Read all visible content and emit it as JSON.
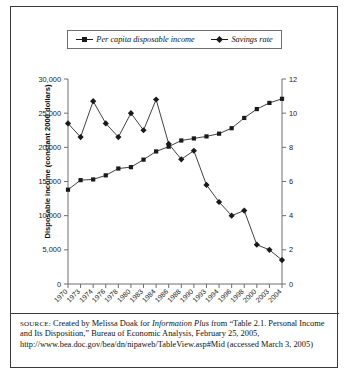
{
  "legend": {
    "items": [
      {
        "label": "Per capita disposable income",
        "marker": "square-marker-icon"
      },
      {
        "label": "Savings rate",
        "marker": "diamond-marker-icon"
      }
    ]
  },
  "axes": {
    "left_title": "Disposable income (constant 2000 dollars)",
    "right_title": "Savings rate (as percent of disposable income)",
    "left_ticks": [
      "30,000",
      "25,000",
      "20,000",
      "15,000",
      "10,000",
      "5,000",
      "0"
    ],
    "right_ticks": [
      "12",
      "10",
      "8",
      "6",
      "4",
      "2",
      "0"
    ]
  },
  "source": {
    "prefix": "SOURCE:",
    "text_1": " Created by Melissa Doak for ",
    "italic_1": "Information Plus",
    "text_2": " from “Table 2.1. Personal Income and Its Disposition,” Bureau of Economic Analysis, February 25, 2005, http://www.bea.doc.gov/bea/dn/nipaweb/TableView.asp#Mid (accessed March 3, 2005)"
  },
  "chart_data": {
    "type": "line",
    "title": "",
    "xlabel": "",
    "ylabel": "Disposable income (constant 2000 dollars)",
    "y2label": "Savings rate (as percent of disposable income)",
    "ylim": [
      0,
      30000
    ],
    "y2lim": [
      0,
      12
    ],
    "grid": false,
    "legend_position": "top",
    "categories": [
      "1970",
      "1973",
      "1974",
      "1976",
      "1978",
      "1980",
      "1983",
      "1984",
      "1986",
      "1988",
      "1990",
      "1993",
      "1994",
      "1996",
      "1998",
      "2000",
      "2003",
      "2004"
    ],
    "series": [
      {
        "name": "Per capita disposable income",
        "axis": "left",
        "marker": "square",
        "values": [
          13800,
          15200,
          15300,
          15900,
          16900,
          17100,
          18200,
          19400,
          20100,
          21000,
          21300,
          21600,
          22000,
          22800,
          24300,
          25600,
          26500,
          27100
        ]
      },
      {
        "name": "Savings rate",
        "axis": "right",
        "marker": "diamond",
        "values": [
          9.4,
          8.6,
          10.7,
          9.4,
          8.6,
          10.0,
          9.0,
          10.8,
          8.2,
          7.3,
          7.8,
          5.8,
          4.8,
          4.0,
          4.3,
          2.3,
          2.0,
          1.4
        ]
      }
    ]
  }
}
